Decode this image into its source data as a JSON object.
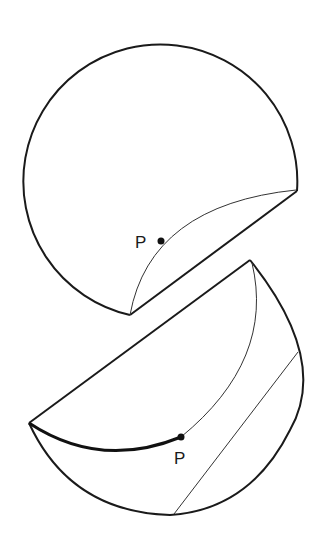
{
  "figure": {
    "top_shape": {
      "label_point": "P",
      "outline_color": "#1a1a1a"
    },
    "bottom_shape": {
      "label_point": "P",
      "outline_color": "#1a1a1a"
    }
  }
}
